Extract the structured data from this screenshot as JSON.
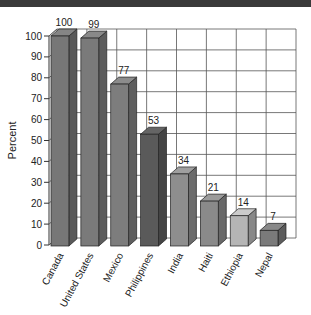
{
  "chart_data": {
    "type": "bar",
    "title": "",
    "xlabel": "",
    "ylabel": "Percent",
    "ylim": [
      0,
      100
    ],
    "yticks": [
      0,
      10,
      20,
      30,
      40,
      50,
      60,
      70,
      80,
      90,
      100
    ],
    "grid": true,
    "style": "3d-bar",
    "categories": [
      "Canada",
      "United States",
      "Mexico",
      "Philippines",
      "India",
      "Haiti",
      "Ethiopia",
      "Nepal"
    ],
    "values": [
      100,
      99,
      77,
      53,
      34,
      21,
      14,
      7
    ],
    "data_labels": [
      "100",
      "99",
      "77",
      "53",
      "34",
      "21",
      "14",
      "7"
    ],
    "bar_colors": [
      "#777777",
      "#7a7a7a",
      "#7d7d7d",
      "#5a5a5a",
      "#8e8e8e",
      "#8a8a8a",
      "#b5b5b5",
      "#7a7a7a"
    ]
  }
}
